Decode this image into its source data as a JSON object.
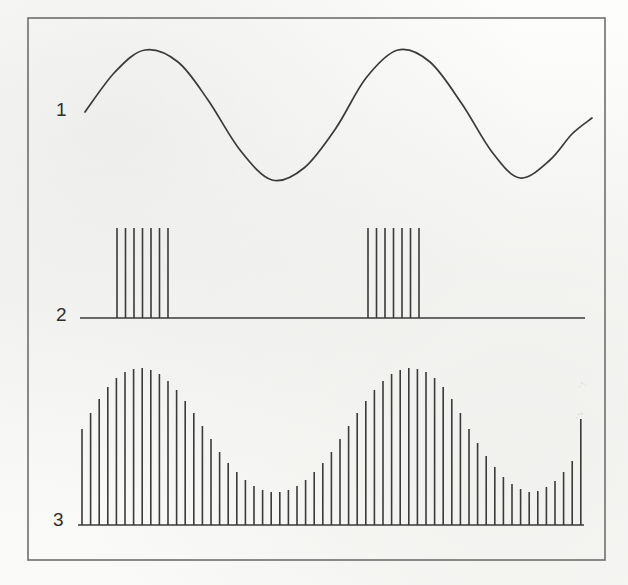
{
  "figure": {
    "background_color": "#fbfbfa",
    "ink_color": "#3a3a3a",
    "border": {
      "x": 28,
      "y": 18,
      "width": 577,
      "height": 542,
      "color": "#6e6e6e",
      "stroke": 1.6
    }
  },
  "rows": [
    {
      "label": "1",
      "label_x": 56,
      "label_y": 100,
      "name": "carrier-sine-wave",
      "kind": "sine"
    },
    {
      "label": "2",
      "label_x": 56,
      "label_y": 305,
      "name": "pulse-burst-train",
      "kind": "pulses"
    },
    {
      "label": "3",
      "label_x": 53,
      "label_y": 510,
      "name": "sampled-modulated-signal",
      "kind": "bars"
    }
  ],
  "smudges": [
    {
      "text": "·˚·",
      "x": 578,
      "y": 381
    },
    {
      "text": "·˚˚",
      "x": 575,
      "y": 412
    }
  ],
  "chart_data": {
    "type": "line",
    "title": "",
    "subtitle": "",
    "xlabel": "",
    "ylabel": "",
    "grid": false,
    "legend": null,
    "panels": [
      {
        "index": 1,
        "label": "1",
        "name": "sine-wave",
        "type": "line",
        "description": "continuous sinusoid, two full cycles",
        "x_start": 85,
        "x_end": 592,
        "baseline_y": 115,
        "amplitude": 65,
        "cycles": 2,
        "phase_deg": 0,
        "peaks_y": 50,
        "troughs_y": 180,
        "points": [
          [
            85,
            112
          ],
          [
            115,
            72
          ],
          [
            145,
            50
          ],
          [
            178,
            62
          ],
          [
            208,
            100
          ],
          [
            240,
            150
          ],
          [
            272,
            180
          ],
          [
            304,
            168
          ],
          [
            336,
            128
          ],
          [
            366,
            78
          ],
          [
            398,
            50
          ],
          [
            430,
            62
          ],
          [
            462,
            104
          ],
          [
            492,
            152
          ],
          [
            520,
            178
          ],
          [
            550,
            160
          ],
          [
            572,
            134
          ],
          [
            592,
            118
          ]
        ]
      },
      {
        "index": 2,
        "label": "2",
        "name": "pulse-bursts",
        "type": "bar",
        "description": "two sampling bursts of seven impulses each on a zero baseline",
        "baseline_y": 318,
        "baseline_x_start": 80,
        "baseline_x_end": 585,
        "pulse_top_y": 228,
        "pulse_height": 90,
        "bursts": [
          {
            "name": "burst-1",
            "x_start": 117,
            "x_end": 168,
            "count": 7,
            "spacing": 8.5
          },
          {
            "name": "burst-2",
            "x_start": 368,
            "x_end": 419,
            "count": 7,
            "spacing": 8.5
          }
        ]
      },
      {
        "index": 3,
        "label": "3",
        "name": "amplitude-modulated-samples",
        "type": "bar",
        "description": "sampled impulse train whose envelope follows the sine of panel 1",
        "baseline_y": 525,
        "x_start": 82,
        "x_end": 580,
        "spacing": 8.6,
        "count": 59,
        "envelope_max_height": 157,
        "envelope_min_height": 33,
        "envelope_cycles": 2,
        "envelope_phase_deg": 0,
        "heights": [
          96,
          112,
          126,
          138,
          147,
          153,
          156,
          157,
          155,
          151,
          144,
          135,
          124,
          112,
          99,
          86,
          73,
          62,
          53,
          45,
          39,
          35,
          33,
          33,
          35,
          39,
          45,
          53,
          62,
          73,
          86,
          99,
          112,
          124,
          135,
          144,
          151,
          155,
          157,
          156,
          153,
          147,
          138,
          126,
          112,
          96,
          82,
          69,
          58,
          48,
          41,
          36,
          33,
          34,
          38,
          44,
          53,
          64,
          106
        ]
      }
    ]
  }
}
